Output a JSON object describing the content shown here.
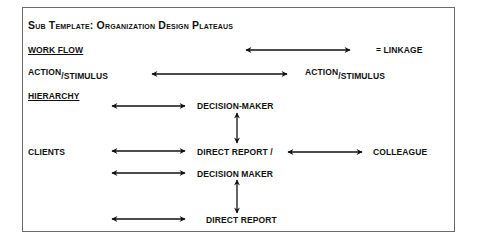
{
  "title": "Sub Template: Organization Design Plateaus",
  "legend": {
    "section_label": "WORK FLOW",
    "linkage_label": "= LINKAGE",
    "arrow_icon": "double-headed-arrow"
  },
  "action_row": {
    "left": {
      "main": "ACTION",
      "slash": "/",
      "sub": "STIMULUS"
    },
    "right": {
      "main": "ACTION",
      "slash": "/",
      "sub": "STIMULUS"
    }
  },
  "hierarchy": {
    "section_label": "HIERARCHY",
    "nodes": [
      {
        "id": "decision_maker_1",
        "label": "DECISION-MAKER"
      },
      {
        "id": "direct_report_decision_maker_a",
        "label": "DIRECT REPORT /"
      },
      {
        "id": "direct_report_decision_maker_b",
        "label": "DECISION MAKER"
      },
      {
        "id": "direct_report_2",
        "label": "DIRECT REPORT"
      }
    ],
    "clients_label": "CLIENTS",
    "colleague_label": "COLLEAGUE"
  },
  "colors": {
    "text": "#111111",
    "frame": "#6a6a6a",
    "background": "#ffffff",
    "arrow": "#111111"
  }
}
